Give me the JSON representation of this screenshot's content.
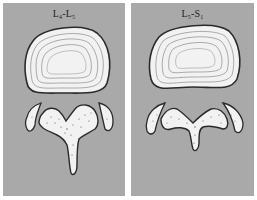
{
  "figure": {
    "panels": [
      {
        "id": "left",
        "label": {
          "a": "L",
          "a_sub": "4",
          "sep": "-",
          "b": "L",
          "b_sub": "5"
        },
        "label_text": "L4-L5",
        "structures": [
          "intervertebral-disc",
          "vertebral-arch",
          "left-facet",
          "right-facet"
        ]
      },
      {
        "id": "right",
        "label": {
          "a": "L",
          "a_sub": "5",
          "sep": "-",
          "b": "S",
          "b_sub": "1"
        },
        "label_text": "L5-S1",
        "structures": [
          "intervertebral-disc",
          "vertebral-arch",
          "left-facet",
          "right-facet"
        ]
      }
    ],
    "colors": {
      "background": "#a9a9a9",
      "bone_fill": "#f2f2f2",
      "outline": "#2a2a2a",
      "disc_rings": "#8a8a8a"
    }
  }
}
